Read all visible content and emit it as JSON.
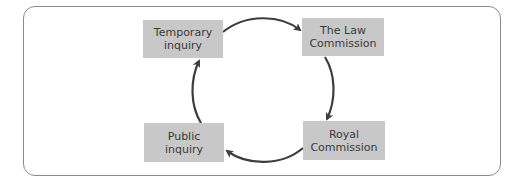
{
  "diagram": {
    "type": "cycle",
    "nodes": [
      {
        "id": "temporary",
        "lines": [
          "Temporary",
          "inquiry"
        ]
      },
      {
        "id": "law",
        "lines": [
          "The Law",
          "Commission"
        ]
      },
      {
        "id": "royal",
        "lines": [
          "Royal",
          "Commission"
        ]
      },
      {
        "id": "public",
        "lines": [
          "Public",
          "inquiry"
        ]
      }
    ],
    "edges": [
      {
        "from": "Temporary inquiry",
        "to": "The Law Commission"
      },
      {
        "from": "The Law Commission",
        "to": "Royal Commission"
      },
      {
        "from": "Royal Commission",
        "to": "Public inquiry"
      },
      {
        "from": "Public inquiry",
        "to": "Temporary inquiry"
      }
    ],
    "colors": {
      "box_fill": "#c8c8c8",
      "text": "#3a3a3a",
      "arrow": "#3d3d3d",
      "frame": "#8a8a8a"
    }
  }
}
